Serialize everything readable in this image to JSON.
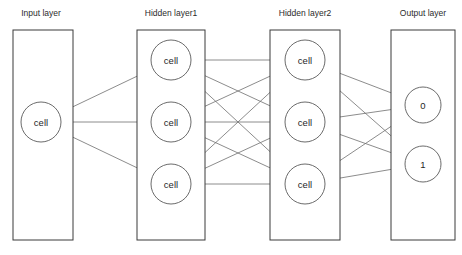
{
  "diagram": {
    "type": "neural-network-diagram",
    "canvas": {
      "width": 462,
      "height": 255,
      "background": "#ffffff"
    },
    "colors": {
      "box_stroke": "#3a3a3a",
      "node_stroke": "#6b6b6b",
      "edge_stroke": "#6f6f6f",
      "arc_stroke": "#8a8a8a",
      "text": "#2b2b2b",
      "ellipsis": "#c9c9c9"
    },
    "layers": [
      {
        "id": "input",
        "label": "Input layer",
        "title_x": 41,
        "title_y": 14,
        "box": {
          "x": 13,
          "y": 30,
          "width": 60,
          "height": 210
        },
        "has_ellipsis": false,
        "ellipsis": "",
        "nodes": [
          {
            "label": "cell",
            "cx": 41,
            "cy": 122,
            "r": 20
          }
        ]
      },
      {
        "id": "hidden1",
        "label": "Hidden layer1",
        "title_x": 171,
        "title_y": 14,
        "box": {
          "x": 137,
          "y": 30,
          "width": 68,
          "height": 210
        },
        "has_ellipsis": true,
        "ellipsis": "...",
        "ellipsis_x": 171,
        "ellipsis_y": 222,
        "nodes": [
          {
            "label": "cell",
            "cx": 171,
            "cy": 60,
            "r": 20
          },
          {
            "label": "cell",
            "cx": 171,
            "cy": 122,
            "r": 20
          },
          {
            "label": "cell",
            "cx": 171,
            "cy": 184,
            "r": 20
          }
        ]
      },
      {
        "id": "hidden2",
        "label": "Hidden layer2",
        "title_x": 305,
        "title_y": 14,
        "box": {
          "x": 270,
          "y": 30,
          "width": 70,
          "height": 210
        },
        "has_ellipsis": true,
        "ellipsis": "...",
        "ellipsis_x": 305,
        "ellipsis_y": 222,
        "nodes": [
          {
            "label": "cell",
            "cx": 305,
            "cy": 60,
            "r": 20
          },
          {
            "label": "cell",
            "cx": 305,
            "cy": 122,
            "r": 20
          },
          {
            "label": "cell",
            "cx": 305,
            "cy": 184,
            "r": 20
          }
        ]
      },
      {
        "id": "output",
        "label": "Output layer",
        "title_x": 423,
        "title_y": 14,
        "box": {
          "x": 391,
          "y": 30,
          "width": 64,
          "height": 210
        },
        "has_ellipsis": false,
        "ellipsis": "",
        "nodes": [
          {
            "label": "0",
            "cx": 423,
            "cy": 105,
            "r": 18
          },
          {
            "label": "1",
            "cx": 423,
            "cy": 164,
            "r": 18
          }
        ]
      }
    ],
    "connections": [
      {
        "from": "input.0",
        "to": "hidden1.0",
        "bidirectional": true
      },
      {
        "from": "input.0",
        "to": "hidden1.1",
        "bidirectional": true
      },
      {
        "from": "input.0",
        "to": "hidden1.2",
        "bidirectional": true
      },
      {
        "from": "hidden1.0",
        "to": "hidden2.0",
        "bidirectional": true
      },
      {
        "from": "hidden1.0",
        "to": "hidden2.1",
        "bidirectional": true
      },
      {
        "from": "hidden1.0",
        "to": "hidden2.2",
        "bidirectional": true
      },
      {
        "from": "hidden1.1",
        "to": "hidden2.0",
        "bidirectional": true
      },
      {
        "from": "hidden1.1",
        "to": "hidden2.1",
        "bidirectional": true
      },
      {
        "from": "hidden1.1",
        "to": "hidden2.2",
        "bidirectional": true
      },
      {
        "from": "hidden1.2",
        "to": "hidden2.0",
        "bidirectional": true
      },
      {
        "from": "hidden1.2",
        "to": "hidden2.1",
        "bidirectional": true
      },
      {
        "from": "hidden1.2",
        "to": "hidden2.2",
        "bidirectional": true
      },
      {
        "from": "hidden2.0",
        "to": "output.0",
        "bidirectional": true
      },
      {
        "from": "hidden2.0",
        "to": "output.1",
        "bidirectional": true
      },
      {
        "from": "hidden2.1",
        "to": "output.0",
        "bidirectional": true
      },
      {
        "from": "hidden2.1",
        "to": "output.1",
        "bidirectional": true
      },
      {
        "from": "hidden2.2",
        "to": "output.0",
        "bidirectional": true
      },
      {
        "from": "hidden2.2",
        "to": "output.1",
        "bidirectional": true
      }
    ],
    "intra_layer_arcs": [
      {
        "layer": "hidden1",
        "from": 0,
        "to": 1
      },
      {
        "layer": "hidden1",
        "from": 1,
        "to": 2
      },
      {
        "layer": "hidden2",
        "from": 0,
        "to": 1
      },
      {
        "layer": "hidden2",
        "from": 1,
        "to": 2
      }
    ]
  }
}
